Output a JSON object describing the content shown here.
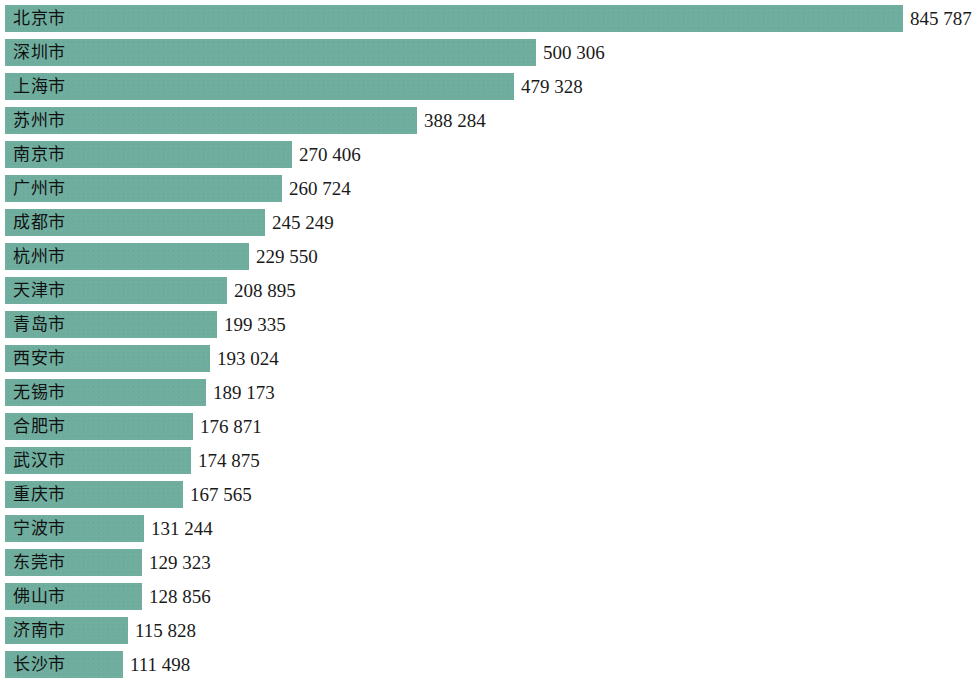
{
  "chart": {
    "type": "bar",
    "orientation": "horizontal",
    "bar_color": "#6fae9f",
    "background_color": "#ffffff",
    "text_color": "#111111",
    "thousands_separator": " "
  },
  "chart_data": {
    "type": "bar",
    "title": "",
    "xlabel": "",
    "ylabel": "",
    "orientation": "horizontal",
    "grid": false,
    "legend": false,
    "xlim": [
      0,
      845787
    ],
    "categories": [
      "北京市",
      "深圳市",
      "上海市",
      "苏州市",
      "南京市",
      "广州市",
      "成都市",
      "杭州市",
      "天津市",
      "青岛市",
      "西安市",
      "无锡市",
      "合肥市",
      "武汉市",
      "重庆市",
      "宁波市",
      "东莞市",
      "佛山市",
      "济南市",
      "长沙市"
    ],
    "values": [
      845787,
      500306,
      479328,
      388284,
      270406,
      260724,
      245249,
      229550,
      208895,
      199335,
      193024,
      189173,
      176871,
      174875,
      167565,
      131244,
      129323,
      128856,
      115828,
      111498
    ],
    "value_labels": [
      "845 787",
      "500 306",
      "479 328",
      "388 284",
      "270 406",
      "260 724",
      "245 249",
      "229 550",
      "208 895",
      "199 335",
      "193 024",
      "189 173",
      "176 871",
      "174 875",
      "167 565",
      "131 244",
      "129 323",
      "128 856",
      "115 828",
      "111 498"
    ]
  }
}
